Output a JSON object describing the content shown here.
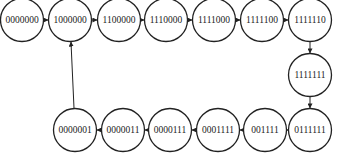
{
  "diagram": {
    "type": "state-transition",
    "nodes": [
      {
        "id": "s0",
        "label": "0000000",
        "x": 22,
        "y": 20
      },
      {
        "id": "s1",
        "label": "1000000",
        "x": 70,
        "y": 20
      },
      {
        "id": "s2",
        "label": "1100000",
        "x": 119,
        "y": 20
      },
      {
        "id": "s3",
        "label": "1110000",
        "x": 166,
        "y": 20
      },
      {
        "id": "s4",
        "label": "1111000",
        "x": 214,
        "y": 20
      },
      {
        "id": "s5",
        "label": "1111100",
        "x": 262,
        "y": 20
      },
      {
        "id": "s6",
        "label": "1111110",
        "x": 310,
        "y": 20
      },
      {
        "id": "s7",
        "label": "1111111",
        "x": 310,
        "y": 75
      },
      {
        "id": "s8",
        "label": "0111111",
        "x": 310,
        "y": 130
      },
      {
        "id": "s9",
        "label": "001111",
        "x": 265,
        "y": 130
      },
      {
        "id": "s10",
        "label": "0001111",
        "x": 218,
        "y": 130
      },
      {
        "id": "s11",
        "label": "0000111",
        "x": 170,
        "y": 130
      },
      {
        "id": "s12",
        "label": "0000011",
        "x": 123,
        "y": 130
      },
      {
        "id": "s13",
        "label": "0000001",
        "x": 75,
        "y": 130
      }
    ],
    "edges": [
      [
        "s0",
        "s1"
      ],
      [
        "s1",
        "s2"
      ],
      [
        "s2",
        "s3"
      ],
      [
        "s3",
        "s4"
      ],
      [
        "s4",
        "s5"
      ],
      [
        "s5",
        "s6"
      ],
      [
        "s6",
        "s7"
      ],
      [
        "s7",
        "s8"
      ],
      [
        "s8",
        "s9"
      ],
      [
        "s9",
        "s10"
      ],
      [
        "s10",
        "s11"
      ],
      [
        "s11",
        "s12"
      ],
      [
        "s12",
        "s13"
      ],
      [
        "s13",
        "s1"
      ]
    ]
  }
}
